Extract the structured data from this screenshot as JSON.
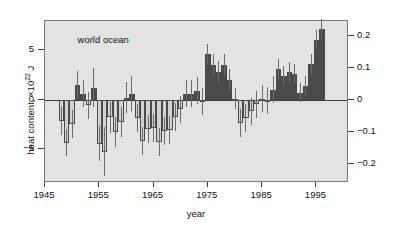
{
  "annotation": "world ocean",
  "axes": {
    "xlabel": "year",
    "ylabel_left_pre": "heat content, ×10",
    "ylabel_left_sup": "22",
    "ylabel_left_post": " J",
    "ylabel_right": "volume mean temperature anomaly, °C",
    "xticks": [
      "1945",
      "1955",
      "1965",
      "1975",
      "1985",
      "1995"
    ],
    "yticks_left": [
      "5",
      "0",
      "−5"
    ],
    "yticks_right": [
      "0.2",
      "0.1",
      "0",
      "−0.1",
      "−0.2"
    ]
  },
  "colors": {
    "plot_background": "#e3e3e3",
    "positive_bar": "#4a4a4a",
    "negative_bar": "#d2d2d2",
    "bar_edge": "#4a4a4a",
    "error_bar": "#6b6b6b",
    "axis": "#3a3a3a",
    "text": "#111111"
  },
  "chart_data": {
    "type": "bar",
    "title": "world ocean",
    "xlabel": "year",
    "ylabel": "heat content, ×10^22 J",
    "ylabel_secondary": "volume mean temperature anomaly, °C",
    "xlim": [
      1945,
      2001
    ],
    "ylim": [
      -8.5,
      8.0
    ],
    "ylim_secondary": [
      -0.25,
      0.235
    ],
    "secondary_axis_scale": 0.0307,
    "grid": false,
    "legend": false,
    "x": [
      1948,
      1949,
      1950,
      1951,
      1952,
      1953,
      1954,
      1955,
      1956,
      1957,
      1958,
      1959,
      1960,
      1961,
      1962,
      1963,
      1964,
      1965,
      1966,
      1967,
      1968,
      1969,
      1970,
      1971,
      1972,
      1973,
      1974,
      1975,
      1976,
      1977,
      1978,
      1979,
      1980,
      1981,
      1982,
      1983,
      1984,
      1985,
      1986,
      1987,
      1988,
      1989,
      1990,
      1991,
      1992,
      1993,
      1994,
      1995,
      1996,
      1997,
      1998,
      1999,
      2000
    ],
    "values": [
      -2.2,
      -4.4,
      -2.5,
      1.5,
      0.6,
      -0.6,
      1.2,
      -4.5,
      -5.3,
      -1.8,
      -3.3,
      -2.3,
      0.2,
      0.6,
      -1.9,
      -4.2,
      -3.0,
      -2.9,
      -4.3,
      -3.2,
      -3.1,
      -1.8,
      -1.0,
      0.6,
      0.6,
      0.9,
      -0.2,
      4.6,
      3.5,
      2.8,
      3.5,
      2.0,
      0.1,
      -2.4,
      -1.9,
      -1.2,
      -0.5,
      0.1,
      -0.1,
      1.0,
      3.1,
      2.4,
      2.8,
      2.6,
      0.7,
      1.4,
      3.6,
      6.1,
      7.2,
      0,
      0,
      0,
      0
    ],
    "error_upper": [
      1.4,
      1.4,
      1.4,
      1.4,
      1.4,
      1.4,
      2.0,
      1.8,
      2.5,
      1.6,
      1.5,
      1.5,
      1.6,
      1.8,
      1.4,
      1.4,
      1.4,
      1.4,
      1.4,
      1.4,
      1.4,
      1.4,
      1.4,
      1.4,
      1.4,
      1.4,
      1.4,
      1.1,
      1.1,
      1.1,
      1.1,
      1.1,
      1.1,
      1.4,
      1.4,
      1.4,
      1.4,
      1.4,
      1.4,
      1.4,
      1.0,
      1.0,
      1.0,
      1.0,
      1.0,
      1.0,
      1.0,
      1.0,
      1.0,
      0,
      0,
      0,
      0
    ],
    "error_lower": [
      1.4,
      1.4,
      1.4,
      1.4,
      1.4,
      1.4,
      2.0,
      1.8,
      2.5,
      1.6,
      1.5,
      1.5,
      1.6,
      1.8,
      1.4,
      1.4,
      1.4,
      1.4,
      1.4,
      1.4,
      1.4,
      1.4,
      1.4,
      1.4,
      1.4,
      1.4,
      1.4,
      1.1,
      1.1,
      1.1,
      1.1,
      1.1,
      1.1,
      1.4,
      1.4,
      1.4,
      1.4,
      1.4,
      1.4,
      1.4,
      1.0,
      1.0,
      1.0,
      1.0,
      1.0,
      1.0,
      1.0,
      1.0,
      1.0,
      0,
      0,
      0,
      0
    ],
    "n_bars": 49,
    "units": "10^22 J"
  }
}
